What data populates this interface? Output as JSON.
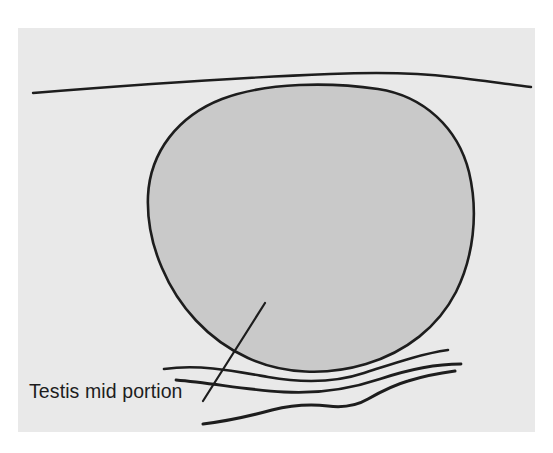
{
  "figure": {
    "kind": "anatomical-line-drawing",
    "canvas": {
      "width": 553,
      "height": 453
    },
    "colors": {
      "page_background": "#ffffff",
      "panel_background": "#e9e9e9",
      "organ_fill": "#c9c9c9",
      "stroke": "#1d1d1d",
      "text": "#1d1d1d"
    },
    "panel": {
      "x": 18,
      "y": 28,
      "width": 517,
      "height": 404
    }
  },
  "labels": {
    "main": "Testis mid portion",
    "main_position": {
      "x": 29,
      "y": 398
    }
  },
  "annotations": {
    "leader_line": {
      "name": "leader-line",
      "from": {
        "x": 203,
        "y": 401
      },
      "to": {
        "x": 265,
        "y": 303
      }
    }
  },
  "shapes": {
    "organ_outline": {
      "name": "testis-outline",
      "description": "shaded rounded oval representing the testis in transverse mid section",
      "path": "M 148 196 C 150 152 178 116 222 99 C 268 82 330 82 378 89 C 424 96 458 128 469 172 C 479 214 473 258 456 292 C 438 327 406 352 366 364 C 326 376 283 374 248 358 C 208 340 178 306 162 268 C 152 245 147 220 148 196 Z"
    },
    "fascial_line_top": {
      "name": "fascial-line-top",
      "description": "long gently arched line above the testis",
      "path": "M 33 93 C 120 86 230 78 330 74 C 380 72 420 73 452 77 C 480 80 506 84 531 87"
    },
    "wavy_line_1": {
      "name": "wavy-line-upper",
      "description": "wavy tissue plane just below the testis, upper of the three",
      "path": "M 164 369 C 200 364 234 371 268 377 C 302 383 334 383 364 373 C 392 364 420 354 448 350"
    },
    "wavy_line_2": {
      "name": "wavy-line-middle",
      "description": "wavy tissue plane below the testis, middle of the three",
      "path": "M 176 380 C 212 383 248 390 284 392 C 318 394 350 389 380 379 C 410 369 436 364 461 364"
    },
    "wavy_line_3": {
      "name": "wavy-line-lower",
      "description": "wavy tissue plane at the bottom of the panel",
      "path": "M 203 424 C 228 421 250 416 272 410 C 292 405 310 404 328 406 C 344 408 356 406 368 399 C 382 391 394 385 408 381 C 424 376 440 373 455 371"
    }
  }
}
